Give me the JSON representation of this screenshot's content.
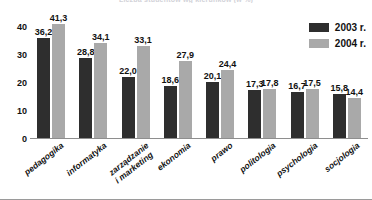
{
  "chart_data": {
    "type": "bar",
    "title": "Liczba studentów wg kierunków (w %)",
    "title_visible": false,
    "xlabel": "",
    "ylabel": "",
    "ylim": [
      0,
      44
    ],
    "yticks": [
      0,
      10,
      20,
      30,
      40
    ],
    "ytick_labels": [
      "0",
      "10",
      "20",
      "30",
      "40"
    ],
    "grid": false,
    "legend_position": "top-right",
    "categories": [
      "pedagogika",
      "informatyka",
      "zarządzanie i marketing",
      "ekonomia",
      "prawo",
      "politologia",
      "psychologia",
      "socjologia"
    ],
    "category_lines": [
      [
        "pedagogika",
        ""
      ],
      [
        "informatyka",
        ""
      ],
      [
        "zarządzanie",
        "i marketing"
      ],
      [
        "ekonomia",
        ""
      ],
      [
        "prawo",
        ""
      ],
      [
        "politologia",
        ""
      ],
      [
        "psychologia",
        ""
      ],
      [
        "socjologia",
        ""
      ]
    ],
    "series": [
      {
        "name": "2003 r.",
        "color": "#2e2e2e",
        "values": [
          36.2,
          28.8,
          22.0,
          18.6,
          20.1,
          17.3,
          16.7,
          15.8
        ],
        "labels": [
          "36,2",
          "28,8",
          "22,0",
          "18,6",
          "20,1",
          "17,3",
          "16,7",
          "15,8"
        ]
      },
      {
        "name": "2004 r.",
        "color": "#a9a9a9",
        "values": [
          41.3,
          34.1,
          33.1,
          27.9,
          24.4,
          17.8,
          17.5,
          14.4
        ],
        "labels": [
          "41,3",
          "34,1",
          "33,1",
          "27,9",
          "24,4",
          "17,8",
          "17,5",
          "14,4"
        ]
      }
    ]
  }
}
